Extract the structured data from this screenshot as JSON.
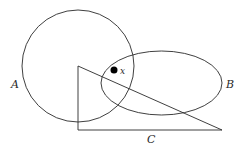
{
  "diagram": {
    "type": "set-diagram",
    "shapes": {
      "circle_A": {
        "label": "A",
        "cx": 78,
        "cy": 66,
        "r": 56
      },
      "ellipse_B": {
        "label": "B",
        "cx": 161.5,
        "cy": 83,
        "rx": 60.5,
        "ry": 32
      },
      "triangle_C": {
        "label": "C",
        "points": [
          [
            78,
            66
          ],
          [
            78,
            130
          ],
          [
            222,
            130
          ]
        ]
      }
    },
    "point": {
      "label": "x",
      "cx": 114,
      "cy": 70,
      "r": 3.5
    },
    "labels": {
      "A": "A",
      "B": "B",
      "C": "C",
      "x": "x"
    },
    "colors": {
      "stroke": "#2a2a2a",
      "background": "#ffffff",
      "point": "#000000"
    }
  }
}
